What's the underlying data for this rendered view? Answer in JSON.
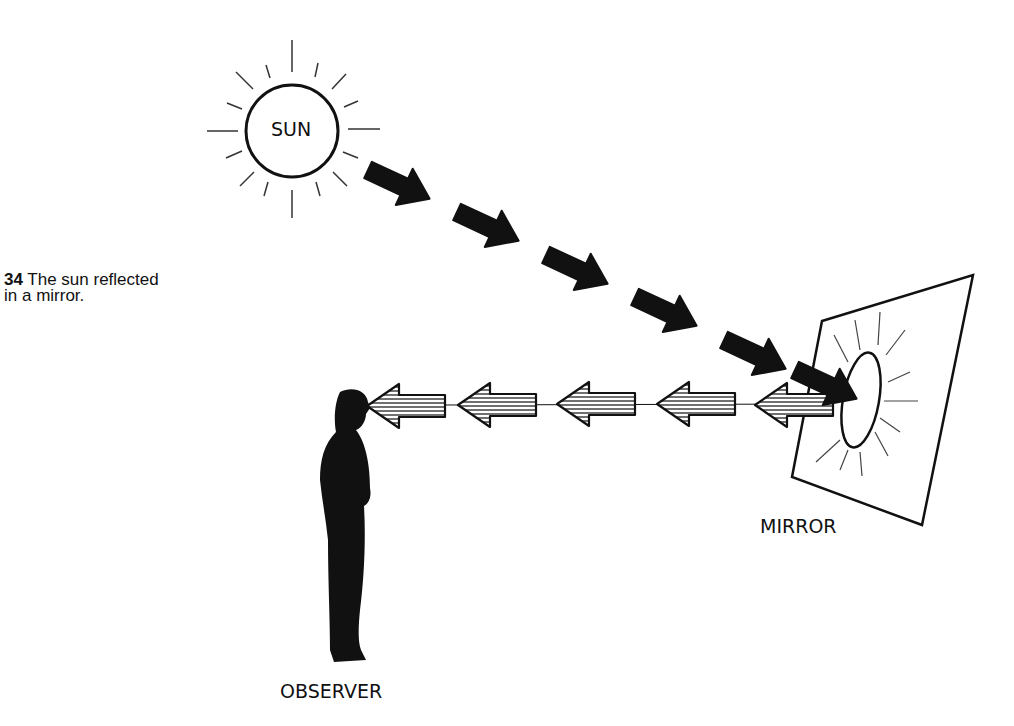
{
  "figure": {
    "caption_number": "34",
    "caption_text": " The sun reflected",
    "caption_text_line2": "in a mirror."
  },
  "labels": {
    "sun": "SUN",
    "mirror": "MIRROR",
    "observer": "OBSERVER"
  },
  "colors": {
    "ink": "#111111",
    "background": "#ffffff"
  },
  "elements": {
    "incoming_arrows_count": 6,
    "reflected_arrows_count": 5,
    "incoming_arrow_style": "solid black",
    "reflected_arrow_style": "horizontal hatched"
  }
}
